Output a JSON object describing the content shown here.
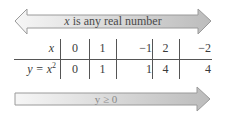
{
  "top_arrow": {
    "label_var": "x",
    "label_rest": " is any real number",
    "direction": "both"
  },
  "table": {
    "header_label": "x",
    "row_label_var": "y = x",
    "row_label_exp": "2",
    "columns": [
      "0",
      "1",
      "−1",
      "2",
      "−2"
    ],
    "values": [
      "0",
      "1",
      "1",
      "4",
      "4"
    ]
  },
  "bottom_arrow": {
    "label": "y ≥ 0",
    "direction": "right"
  },
  "colors": {
    "arrow_fill_light": "#f4f4f4",
    "arrow_fill_dark": "#bdbdbd",
    "arrow_stroke": "#9a9a9a",
    "rule": "#555555"
  }
}
